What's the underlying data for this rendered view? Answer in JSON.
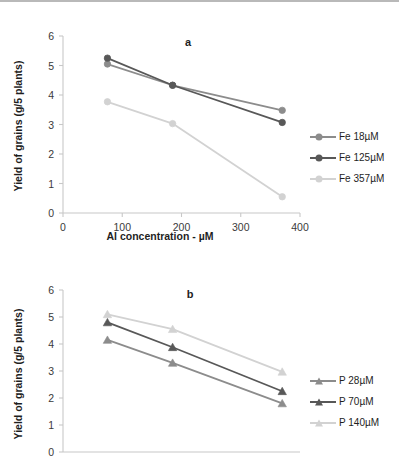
{
  "figure": {
    "panels": [
      "a",
      "b"
    ]
  },
  "chart_data": [
    {
      "type": "line",
      "title": "a",
      "panel_label": "a",
      "xlabel": "Al concentration - µM",
      "ylabel": "Yield of grains (g/5 plants)",
      "xlim": [
        0,
        400
      ],
      "ylim": [
        0,
        6
      ],
      "xticks": [
        0,
        100,
        200,
        300,
        400
      ],
      "yticks": [
        0,
        1,
        2,
        3,
        4,
        5,
        6
      ],
      "grid": false,
      "legend_position": "right",
      "marker": "circle",
      "x": [
        75,
        185,
        370
      ],
      "series": [
        {
          "name": "Fe 18µM",
          "values": [
            5.05,
            4.33,
            3.48
          ],
          "color": "#8c8c8c"
        },
        {
          "name": "Fe 125µM",
          "values": [
            5.25,
            4.33,
            3.07
          ],
          "color": "#585858"
        },
        {
          "name": "Fe 357µM",
          "values": [
            3.77,
            3.03,
            0.55
          ],
          "color": "#d2d2d2"
        }
      ]
    },
    {
      "type": "line",
      "title": "b",
      "panel_label": "b",
      "xlabel": "",
      "ylabel": "Yield of grains (g/5 plants)",
      "xlim": [
        0,
        400
      ],
      "ylim": [
        0,
        6
      ],
      "xticks": [],
      "yticks": [
        0,
        1,
        2,
        3,
        4,
        5,
        6
      ],
      "grid": false,
      "legend_position": "right",
      "marker": "triangle",
      "x": [
        75,
        185,
        370
      ],
      "series": [
        {
          "name": "P 28µM",
          "values": [
            4.15,
            3.3,
            1.8
          ],
          "color": "#8c8c8c"
        },
        {
          "name": "P 70µM",
          "values": [
            4.8,
            3.88,
            2.25
          ],
          "color": "#585858"
        },
        {
          "name": "P 140µM",
          "values": [
            5.1,
            4.55,
            2.97
          ],
          "color": "#d2d2d2"
        }
      ]
    }
  ],
  "panel_a": {
    "label": "a",
    "ylabel": "Yield of grains (g/5 plants)",
    "xlabel": "Al concentration - µM",
    "yticks": [
      "0",
      "1",
      "2",
      "3",
      "4",
      "5",
      "6"
    ],
    "xticks": [
      "0",
      "100",
      "200",
      "300",
      "400"
    ],
    "legend": [
      {
        "label": "Fe 18µM",
        "color": "#8c8c8c"
      },
      {
        "label": "Fe 125µM",
        "color": "#585858"
      },
      {
        "label": "Fe 357µM",
        "color": "#d2d2d2"
      }
    ]
  },
  "panel_b": {
    "label": "b",
    "ylabel": "Yield of grains (g/5 plants)",
    "xlabel": "",
    "yticks": [
      "0",
      "1",
      "2",
      "3",
      "4",
      "5",
      "6"
    ],
    "xticks": [],
    "legend": [
      {
        "label": "P 28µM",
        "color": "#8c8c8c"
      },
      {
        "label": "P 70µM",
        "color": "#585858"
      },
      {
        "label": "P 140µM",
        "color": "#d2d2d2"
      }
    ]
  }
}
